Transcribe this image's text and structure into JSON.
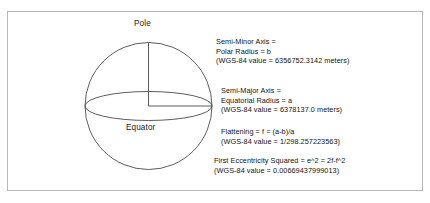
{
  "figure": {
    "background_color": "#ffffff",
    "frame_color": "#b9b9b9",
    "line_color": "#4a4a4a",
    "text_color": "#141414"
  },
  "diagram": {
    "pole_label": "Pole",
    "equator_label": "Equator",
    "shape": "sphere-with-equatorial-ellipse",
    "semi_minor_line": "vertical radius from center to pole",
    "semi_major_line": "horizontal radius from center to equatorial rim"
  },
  "annotations": [
    {
      "id": "semi-minor",
      "lines": [
        "Semi-Minor Axis =",
        "Polar Radius = b",
        "(WGS-84 value = 6356752.3142 meters)"
      ],
      "symbol": "b",
      "wgs84_value": "6356752.3142 meters"
    },
    {
      "id": "semi-major",
      "lines": [
        "Semi-Major Axis =",
        "Equatorial Radius = a",
        "(WGS-84 value = 6378137.0 meters)"
      ],
      "symbol": "a",
      "wgs84_value": "6378137.0 meters"
    },
    {
      "id": "flattening",
      "lines": [
        "Flattening = f = (a-b)/a",
        "(WGS-84 value = 1/298.257223563)"
      ],
      "symbol": "f",
      "wgs84_value": "1/298.257223563"
    },
    {
      "id": "eccentricity",
      "lines": [
        "First Eccentricity Squared = e^2 = 2f-f^2",
        "(WGS-84 value = 0.00669437999013)"
      ],
      "symbol": "e^2",
      "wgs84_value": "0.00669437999013"
    }
  ]
}
